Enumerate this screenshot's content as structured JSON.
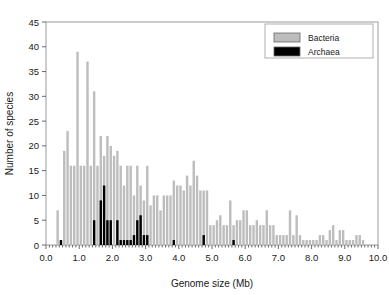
{
  "chart_data": {
    "type": "bar",
    "title": "",
    "subtitle": "",
    "xlabel": "Genome size (Mb)",
    "ylabel": "Number of species",
    "xlim": [
      0.0,
      10.0
    ],
    "ylim": [
      0,
      45
    ],
    "xticks": [
      "0.0",
      "1.0",
      "2.0",
      "3.0",
      "4.0",
      "5.0",
      "6.0",
      "7.0",
      "8.0",
      "9.0",
      "10.0"
    ],
    "xtick_values": [
      0.0,
      1.0,
      2.0,
      3.0,
      4.0,
      5.0,
      6.0,
      7.0,
      8.0,
      9.0,
      10.0
    ],
    "yticks": [
      "0",
      "5",
      "10",
      "15",
      "20",
      "25",
      "30",
      "35",
      "40",
      "45"
    ],
    "ytick_values": [
      0,
      5,
      10,
      15,
      20,
      25,
      30,
      35,
      40,
      45
    ],
    "grid": false,
    "bin_width": 0.1,
    "legend_position": "top-right",
    "legend": [
      {
        "name": "Bacteria",
        "color": "#bdbdbd"
      },
      {
        "name": "Archaea",
        "color": "#000000"
      }
    ],
    "x": [
      0.35,
      0.45,
      0.55,
      0.65,
      0.75,
      0.85,
      0.95,
      1.05,
      1.15,
      1.25,
      1.35,
      1.45,
      1.55,
      1.65,
      1.75,
      1.85,
      1.95,
      2.05,
      2.15,
      2.25,
      2.35,
      2.45,
      2.55,
      2.65,
      2.75,
      2.85,
      2.95,
      3.05,
      3.15,
      3.25,
      3.35,
      3.45,
      3.55,
      3.65,
      3.75,
      3.85,
      3.95,
      4.05,
      4.15,
      4.25,
      4.35,
      4.45,
      4.55,
      4.65,
      4.75,
      4.85,
      4.95,
      5.05,
      5.15,
      5.25,
      5.35,
      5.45,
      5.55,
      5.65,
      5.75,
      5.85,
      5.95,
      6.05,
      6.15,
      6.25,
      6.35,
      6.45,
      6.55,
      6.65,
      6.75,
      6.85,
      6.95,
      7.05,
      7.15,
      7.25,
      7.35,
      7.45,
      7.55,
      7.65,
      7.75,
      7.85,
      7.95,
      8.05,
      8.15,
      8.25,
      8.35,
      8.45,
      8.55,
      8.65,
      8.75,
      8.85,
      8.95,
      9.05,
      9.15,
      9.25,
      9.35,
      9.45,
      9.55
    ],
    "series": [
      {
        "name": "Bacteria",
        "color": "#bdbdbd",
        "values": [
          7,
          1,
          19,
          23,
          16,
          16,
          39,
          16,
          16,
          37,
          16,
          31,
          16,
          22,
          18,
          22,
          20,
          18,
          19,
          16,
          12,
          16,
          16,
          10,
          16,
          12,
          9,
          16,
          8,
          10,
          10,
          7,
          10,
          10,
          10,
          13,
          12,
          12,
          11,
          14,
          12,
          17,
          14,
          11,
          11,
          11,
          4,
          4,
          5,
          6,
          4,
          4,
          9,
          4,
          5,
          5,
          7,
          7,
          4,
          4,
          5,
          4,
          4,
          7,
          4,
          4,
          2,
          2,
          2,
          2,
          7,
          2,
          6,
          2,
          1,
          1,
          1,
          1,
          1,
          2,
          2,
          1,
          3,
          4,
          1,
          3,
          3,
          1,
          1,
          1,
          2,
          2,
          1
        ]
      },
      {
        "name": "Archaea",
        "color": "#000000",
        "values": [
          0,
          1,
          0,
          0,
          0,
          0,
          0,
          0,
          0,
          0,
          0,
          5,
          0,
          9,
          12,
          5,
          5,
          0,
          5,
          1,
          1,
          1,
          1,
          2,
          5,
          6,
          2,
          2,
          0,
          0,
          0,
          0,
          0,
          0,
          0,
          1,
          0,
          0,
          0,
          0,
          0,
          0,
          0,
          0,
          2,
          0,
          0,
          0,
          0,
          0,
          0,
          0,
          0,
          1,
          0,
          0,
          0,
          0,
          0,
          0,
          0,
          0,
          0,
          0,
          0,
          0,
          0,
          0,
          0,
          0,
          0,
          0,
          0,
          0,
          0,
          0,
          0,
          0,
          0,
          0,
          0,
          0,
          0,
          0,
          0,
          0,
          0,
          0,
          0,
          0,
          0,
          0,
          0
        ]
      }
    ]
  }
}
